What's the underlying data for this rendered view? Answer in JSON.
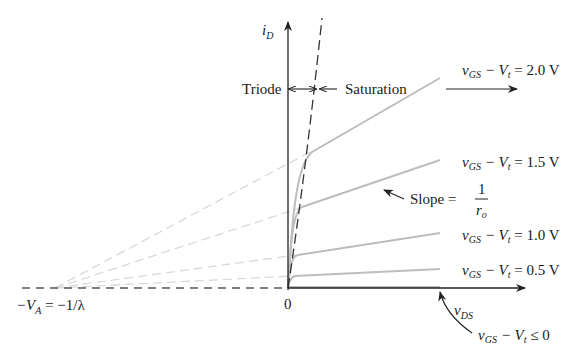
{
  "figure": {
    "y_axis_label": {
      "main": "i",
      "sub": "D"
    },
    "x_axis_label": {
      "main": "v",
      "sub": "DS"
    },
    "origin_label": "0",
    "intercept_label": {
      "part1": "−V",
      "sub": "A",
      "part2": " = −1/λ"
    },
    "region_labels": {
      "triode": "Triode",
      "saturation": "Saturation"
    },
    "slope_label": {
      "text": "Slope = ",
      "numerator": "1",
      "denominator_main": "r",
      "denominator_sub": "o"
    },
    "curves": [
      {
        "id": "vov-2.0",
        "label": {
          "v": "v",
          "gs": "GS",
          "minus": " − V",
          "t": "t",
          "rest": " = 2.0 V"
        }
      },
      {
        "id": "vov-1.5",
        "label": {
          "v": "v",
          "gs": "GS",
          "minus": " − V",
          "t": "t",
          "rest": " = 1.5 V"
        }
      },
      {
        "id": "vov-1.0",
        "label": {
          "v": "v",
          "gs": "GS",
          "minus": " − V",
          "t": "t",
          "rest": " = 1.0 V"
        }
      },
      {
        "id": "vov-0.5",
        "label": {
          "v": "v",
          "gs": "GS",
          "minus": " − V",
          "t": "t",
          "rest": " = 0.5 V"
        }
      },
      {
        "id": "vov-0",
        "label": {
          "v": "v",
          "gs": "GS",
          "minus": " − V",
          "t": "t",
          "rest": " ≤ 0"
        }
      }
    ],
    "colors": {
      "curve": "#bdbdbd",
      "extension": "#d9d9d9",
      "axis": "#222222"
    }
  }
}
